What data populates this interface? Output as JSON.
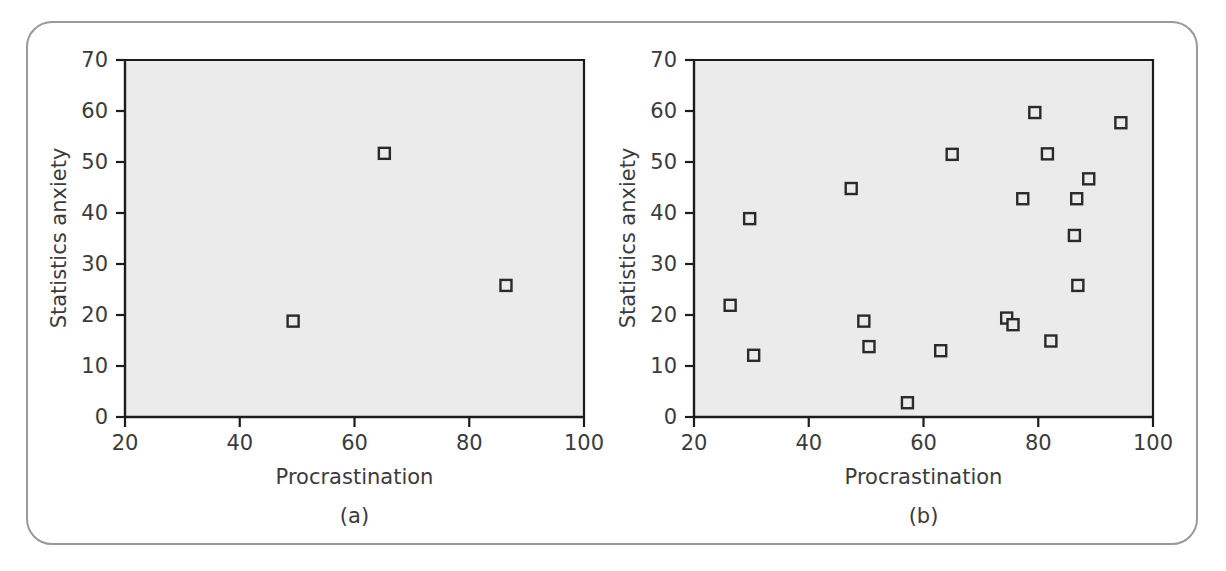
{
  "figure": {
    "background_color": "#ffffff",
    "frame_color": "#9a9a9a",
    "plot_background_color": "#ebebeb",
    "marker_stroke_color": "#2a2a2a",
    "axis_color": "#1c1c1c",
    "text_color": "#3b3b3b"
  },
  "panels": [
    {
      "caption": "(a)",
      "xlabel": "Procrastination",
      "ylabel": "Statistics anxiety",
      "xticks": [
        "20",
        "40",
        "60",
        "80",
        "100"
      ],
      "yticks": [
        "0",
        "10",
        "20",
        "30",
        "40",
        "50",
        "60",
        "70"
      ]
    },
    {
      "caption": "(b)",
      "xlabel": "Procrastination",
      "ylabel": "Statistics anxiety",
      "xticks": [
        "20",
        "40",
        "60",
        "80",
        "100"
      ],
      "yticks": [
        "0",
        "10",
        "20",
        "30",
        "40",
        "50",
        "60",
        "70"
      ]
    }
  ],
  "chart_data": [
    {
      "type": "scatter",
      "title": "(a)",
      "xlabel": "Procrastination",
      "ylabel": "Statistics anxiety",
      "xlim": [
        20,
        100
      ],
      "ylim": [
        0,
        70
      ],
      "xticks": [
        20,
        40,
        60,
        80,
        100
      ],
      "yticks": [
        0,
        10,
        20,
        30,
        40,
        50,
        60,
        70
      ],
      "grid": false,
      "legend": null,
      "marker": "open-square",
      "points": [
        {
          "x": 49.3,
          "y": 18.8
        },
        {
          "x": 65.2,
          "y": 51.7
        },
        {
          "x": 86.4,
          "y": 25.8
        }
      ]
    },
    {
      "type": "scatter",
      "title": "(b)",
      "xlabel": "Procrastination",
      "ylabel": "Statistics anxiety",
      "xlim": [
        20,
        100
      ],
      "ylim": [
        0,
        70
      ],
      "xticks": [
        20,
        40,
        60,
        80,
        100
      ],
      "yticks": [
        0,
        10,
        20,
        30,
        40,
        50,
        60,
        70
      ],
      "grid": false,
      "legend": null,
      "marker": "open-square",
      "points": [
        {
          "x": 26.3,
          "y": 21.9
        },
        {
          "x": 29.7,
          "y": 38.9
        },
        {
          "x": 30.4,
          "y": 12.1
        },
        {
          "x": 47.4,
          "y": 44.8
        },
        {
          "x": 49.6,
          "y": 18.8
        },
        {
          "x": 50.5,
          "y": 13.8
        },
        {
          "x": 57.2,
          "y": 2.8
        },
        {
          "x": 63.0,
          "y": 13.0
        },
        {
          "x": 65.0,
          "y": 51.5
        },
        {
          "x": 74.5,
          "y": 19.4
        },
        {
          "x": 75.6,
          "y": 18.1
        },
        {
          "x": 77.3,
          "y": 42.8
        },
        {
          "x": 79.4,
          "y": 59.7
        },
        {
          "x": 81.6,
          "y": 51.6
        },
        {
          "x": 82.2,
          "y": 14.9
        },
        {
          "x": 86.3,
          "y": 35.6
        },
        {
          "x": 86.7,
          "y": 42.8
        },
        {
          "x": 86.9,
          "y": 25.8
        },
        {
          "x": 88.8,
          "y": 46.7
        },
        {
          "x": 94.4,
          "y": 57.7
        }
      ]
    }
  ]
}
